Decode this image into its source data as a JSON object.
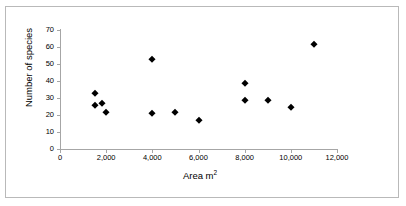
{
  "chart_data": {
    "type": "scatter",
    "title": "",
    "xlabel": "Area m2",
    "xlabel_base": "Area m",
    "xlabel_sup": "2",
    "ylabel": "Number of species",
    "xlim": [
      0,
      12000
    ],
    "ylim": [
      0,
      70
    ],
    "grid": false,
    "legend": "none",
    "marker": "diamond",
    "marker_color": "#000000",
    "xticks": [
      0,
      2000,
      4000,
      6000,
      8000,
      10000,
      12000
    ],
    "xtick_labels": [
      "0",
      "2,000",
      "4,000",
      "6,000",
      "8,000",
      "10,000",
      "12,000"
    ],
    "yticks": [
      0,
      10,
      20,
      30,
      40,
      50,
      60,
      70
    ],
    "ytick_labels": [
      "0",
      "10",
      "20",
      "30",
      "40",
      "50",
      "60",
      "70"
    ],
    "series": [
      {
        "name": "Species richness vs area",
        "points": [
          {
            "x": 1500,
            "y": 33
          },
          {
            "x": 1500,
            "y": 26
          },
          {
            "x": 1800,
            "y": 27
          },
          {
            "x": 2000,
            "y": 22
          },
          {
            "x": 4000,
            "y": 53
          },
          {
            "x": 4000,
            "y": 21
          },
          {
            "x": 5000,
            "y": 22
          },
          {
            "x": 6000,
            "y": 17
          },
          {
            "x": 8000,
            "y": 39
          },
          {
            "x": 8000,
            "y": 29
          },
          {
            "x": 9000,
            "y": 29
          },
          {
            "x": 10000,
            "y": 25
          },
          {
            "x": 11000,
            "y": 62
          }
        ]
      }
    ]
  }
}
